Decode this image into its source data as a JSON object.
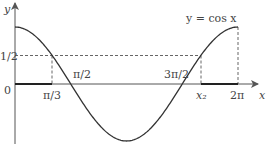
{
  "chart_data": {
    "type": "line",
    "title": "",
    "curve_label": "y = cos x",
    "xlabel": "x",
    "ylabel": "y",
    "origin_label": "0",
    "x_ticks": [
      "π/3",
      "π/2",
      "3π/2",
      "x₂",
      "2π"
    ],
    "y_ticks": [
      "1/2"
    ],
    "xlim": [
      0,
      6.2832
    ],
    "ylim": [
      -1,
      1
    ],
    "series": [
      {
        "name": "y = cos x",
        "x": [
          0,
          1.0472,
          1.5708,
          3.1416,
          4.7124,
          5.236,
          6.2832
        ],
        "y": [
          1,
          0.5,
          0,
          -1,
          0,
          0.5,
          1
        ]
      }
    ],
    "annotations": [
      {
        "type": "dashed-hline",
        "y": 0.5,
        "from_x": 0,
        "to_x": 5.236
      },
      {
        "type": "dashed-vline",
        "x": 1.0472,
        "label": "π/3"
      },
      {
        "type": "dashed-vline",
        "x": 5.236,
        "label": "x₂"
      },
      {
        "type": "dashed-vline",
        "x": 6.2832,
        "label": "2π"
      },
      {
        "type": "highlighted-interval",
        "from": 0,
        "to": 1.0472
      },
      {
        "type": "highlighted-interval",
        "from": 5.236,
        "to": 6.2832
      }
    ],
    "grid": false
  },
  "colors": {
    "curve": "#333333",
    "axis": "#555555",
    "dash": "#666666"
  }
}
